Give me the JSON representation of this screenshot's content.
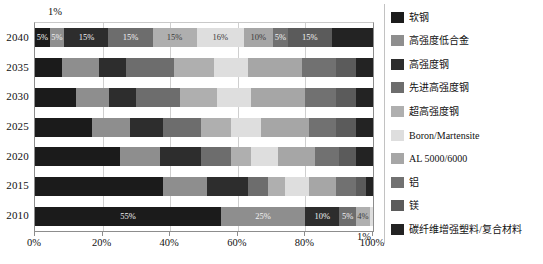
{
  "chart_data": {
    "type": "bar",
    "orientation": "horizontal",
    "stacked": true,
    "normalized": true,
    "title": "",
    "xlabel": "",
    "ylabel": "",
    "xlim": [
      0,
      100
    ],
    "grid": true,
    "legend_position": "right",
    "categories": [
      "2040",
      "2035",
      "2030",
      "2025",
      "2020",
      "2015",
      "2010"
    ],
    "xticks": [
      "0%",
      "20%",
      "40%",
      "60%",
      "80%",
      "100%"
    ],
    "xtick_values": [
      0,
      20,
      40,
      60,
      80,
      100
    ],
    "annotations": [
      {
        "text": "1%",
        "position": "above-plot-left"
      },
      {
        "text": "1%",
        "position": "above-100-percent-tick"
      }
    ],
    "series": [
      {
        "name": "软钢",
        "color": "#1b1b1b",
        "values": [
          5,
          8,
          12,
          17,
          25,
          38,
          55
        ]
      },
      {
        "name": "高强度低合金",
        "color": "#8e8e8e",
        "values": [
          5,
          11,
          10,
          11,
          12,
          13,
          25
        ]
      },
      {
        "name": "高强度钢",
        "color": "#2d2d2d",
        "values": [
          15,
          8,
          8,
          10,
          12,
          12,
          10
        ]
      },
      {
        "name": "先进高强度钢",
        "color": "#6d6d6d",
        "values": [
          15,
          14,
          13,
          11,
          9,
          6,
          5
        ]
      },
      {
        "name": "超高强度钢",
        "color": "#afafaf",
        "values": [
          15,
          12,
          11,
          9,
          6,
          5,
          4
        ]
      },
      {
        "name": "Boron/Martensite",
        "color": "#dedede",
        "values": [
          16,
          10,
          10,
          9,
          8,
          7,
          1
        ]
      },
      {
        "name": "AL 5000/6000",
        "color": "#a6a6a6",
        "values": [
          10,
          16,
          16,
          14,
          11,
          8,
          0
        ]
      },
      {
        "name": "铝",
        "color": "#717171",
        "values": [
          5,
          10,
          9,
          8,
          7,
          6,
          0
        ]
      },
      {
        "name": "镁",
        "color": "#5b5b5b",
        "values": [
          15,
          6,
          6,
          6,
          5,
          3,
          0
        ]
      },
      {
        "name": "碳纤维增强塑料/复合材料",
        "color": "#232323",
        "values": [
          14,
          5,
          5,
          5,
          5,
          2,
          0
        ]
      }
    ],
    "value_labels": {
      "2040": [
        "5%",
        "5%",
        "15%",
        "15%",
        "15%",
        "16%",
        "10%",
        "5%",
        "15%",
        ""
      ],
      "2010": [
        "55%",
        "25%",
        "10%",
        "5%",
        "4%",
        "",
        "",
        "",
        "",
        ""
      ]
    }
  },
  "axis": {
    "y_labels": [
      "2040",
      "2035",
      "2030",
      "2025",
      "2020",
      "2015",
      "2010"
    ],
    "x_labels": [
      "0%",
      "20%",
      "40%",
      "60%",
      "80%",
      "100%"
    ],
    "note_top_left": "1%",
    "note_right": "1%"
  },
  "legend": {
    "items": [
      {
        "label": "软钢",
        "color": "#1b1b1b"
      },
      {
        "label": "高强度低合金",
        "color": "#8e8e8e"
      },
      {
        "label": "高强度钢",
        "color": "#2d2d2d"
      },
      {
        "label": "先进高强度钢",
        "color": "#6d6d6d"
      },
      {
        "label": "超高强度钢",
        "color": "#afafaf"
      },
      {
        "label": "Boron/Martensite",
        "color": "#dedede"
      },
      {
        "label": "AL 5000/6000",
        "color": "#a6a6a6"
      },
      {
        "label": "铝",
        "color": "#717171"
      },
      {
        "label": "镁",
        "color": "#5b5b5b"
      },
      {
        "label": "碳纤维增强塑料/复合材料",
        "color": "#232323"
      }
    ]
  }
}
